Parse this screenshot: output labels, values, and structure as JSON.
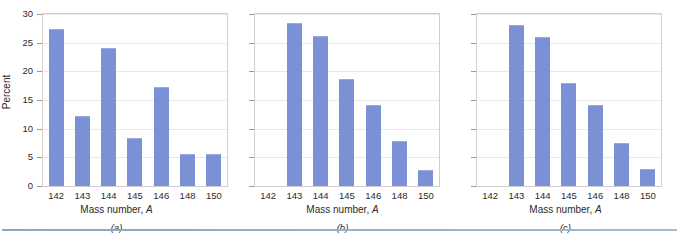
{
  "figure": {
    "axis_title_x": "Mass number,",
    "axis_title_x_italic": "A",
    "axis_title_y": "Percent",
    "bar_color": "#7b91d6",
    "rule_color": "#8ea2c4"
  },
  "chart_data": [
    {
      "type": "bar",
      "panel_label": "(a)",
      "title": "",
      "xlabel": "Mass number, A",
      "ylabel": "Percent",
      "categories": [
        "142",
        "143",
        "144",
        "145",
        "146",
        "148",
        "150"
      ],
      "values": [
        27.3,
        12.2,
        24.0,
        8.3,
        17.2,
        5.6,
        5.6
      ],
      "ylim": [
        0,
        30
      ],
      "yticks": [
        0,
        5,
        10,
        15,
        20,
        25,
        30
      ],
      "ytick_labels": [
        "0",
        "5",
        "10",
        "15",
        "20",
        "25",
        "30"
      ],
      "y_axis_labels_visible": true,
      "grid": true,
      "legend": null
    },
    {
      "type": "bar",
      "panel_label": "(b)",
      "title": "",
      "xlabel": "Mass number, A",
      "ylabel": "",
      "categories": [
        "142",
        "143",
        "144",
        "145",
        "146",
        "148",
        "150"
      ],
      "values": [
        0,
        28.5,
        26.1,
        18.7,
        14.2,
        7.9,
        2.8
      ],
      "ylim": [
        0,
        30
      ],
      "yticks": [
        0,
        5,
        10,
        15,
        20,
        25,
        30
      ],
      "ytick_labels": [
        "",
        "",
        "",
        "",
        "",
        "",
        ""
      ],
      "y_axis_labels_visible": false,
      "grid": true,
      "legend": null
    },
    {
      "type": "bar",
      "panel_label": "(c)",
      "title": "",
      "xlabel": "Mass number, A",
      "ylabel": "",
      "categories": [
        "142",
        "143",
        "144",
        "145",
        "146",
        "148",
        "150"
      ],
      "values": [
        0,
        28.0,
        26.0,
        18.0,
        14.2,
        7.5,
        3.0
      ],
      "ylim": [
        0,
        30
      ],
      "yticks": [
        0,
        5,
        10,
        15,
        20,
        25,
        30
      ],
      "ytick_labels": [
        "",
        "",
        "",
        "",
        "",
        "",
        ""
      ],
      "y_axis_labels_visible": false,
      "grid": true,
      "legend": null
    }
  ]
}
